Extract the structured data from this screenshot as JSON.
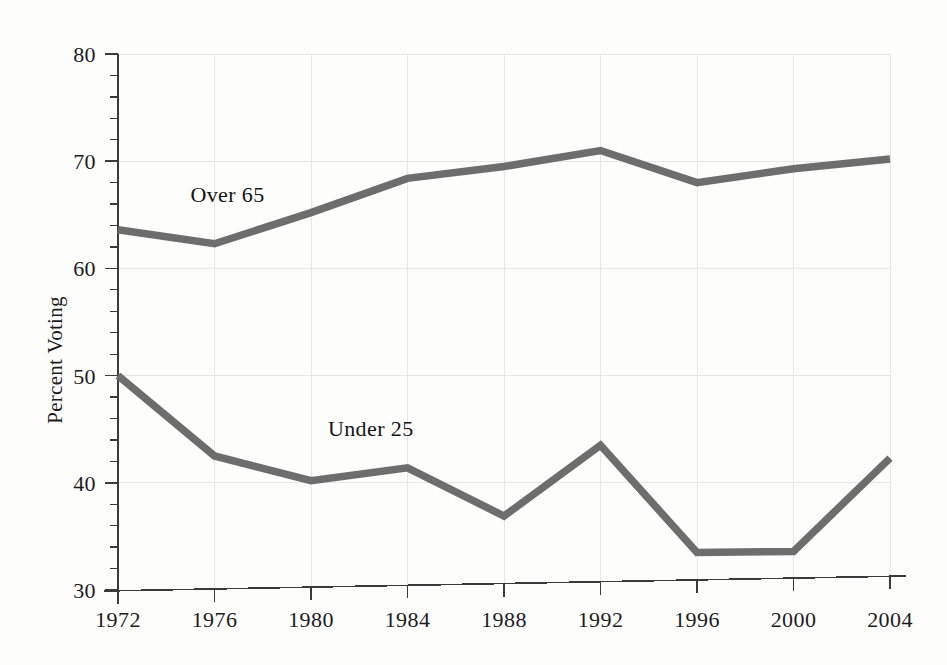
{
  "chart_data": {
    "type": "line",
    "title": "",
    "subtitle": "",
    "xlabel": "",
    "ylabel": "Percent Voting",
    "x": [
      1972,
      1976,
      1980,
      1984,
      1988,
      1992,
      1996,
      2000,
      2004
    ],
    "categories": [
      "1972",
      "1976",
      "1980",
      "1984",
      "1988",
      "1992",
      "1996",
      "2000",
      "2004"
    ],
    "xlim": [
      1972,
      2004
    ],
    "ylim": [
      30,
      80
    ],
    "y_major_ticks": [
      30,
      40,
      50,
      60,
      70,
      80
    ],
    "y_minor_tick_step": 2,
    "y_tick_labels": [
      "30",
      "40",
      "50",
      "60",
      "70",
      "80"
    ],
    "grid": true,
    "grid_color": "#e6e6e6",
    "legend": "inline-labels",
    "series": [
      {
        "name": "Over 65",
        "label": "Over 65",
        "color": "#6e6d6d",
        "values": [
          63.6,
          62.3,
          65.2,
          68.4,
          69.5,
          71.0,
          68.0,
          69.3,
          70.2
        ]
      },
      {
        "name": "Under 25",
        "label": "Under 25",
        "color": "#6e6d6d",
        "values": [
          50.0,
          42.5,
          40.2,
          41.4,
          36.9,
          43.5,
          33.5,
          33.6,
          42.3
        ]
      }
    ],
    "annotations": [
      {
        "text": "Over 65",
        "x": 1975.0,
        "y": 66.2
      },
      {
        "text": "Under 25",
        "x": 1980.7,
        "y": 44.4
      }
    ]
  },
  "colors": {
    "background": "#fdfdfc",
    "axis": "#3b3b3b",
    "grid": "#e6e6e6",
    "series": "#6e6d6d",
    "text": "#1c1c1c"
  }
}
